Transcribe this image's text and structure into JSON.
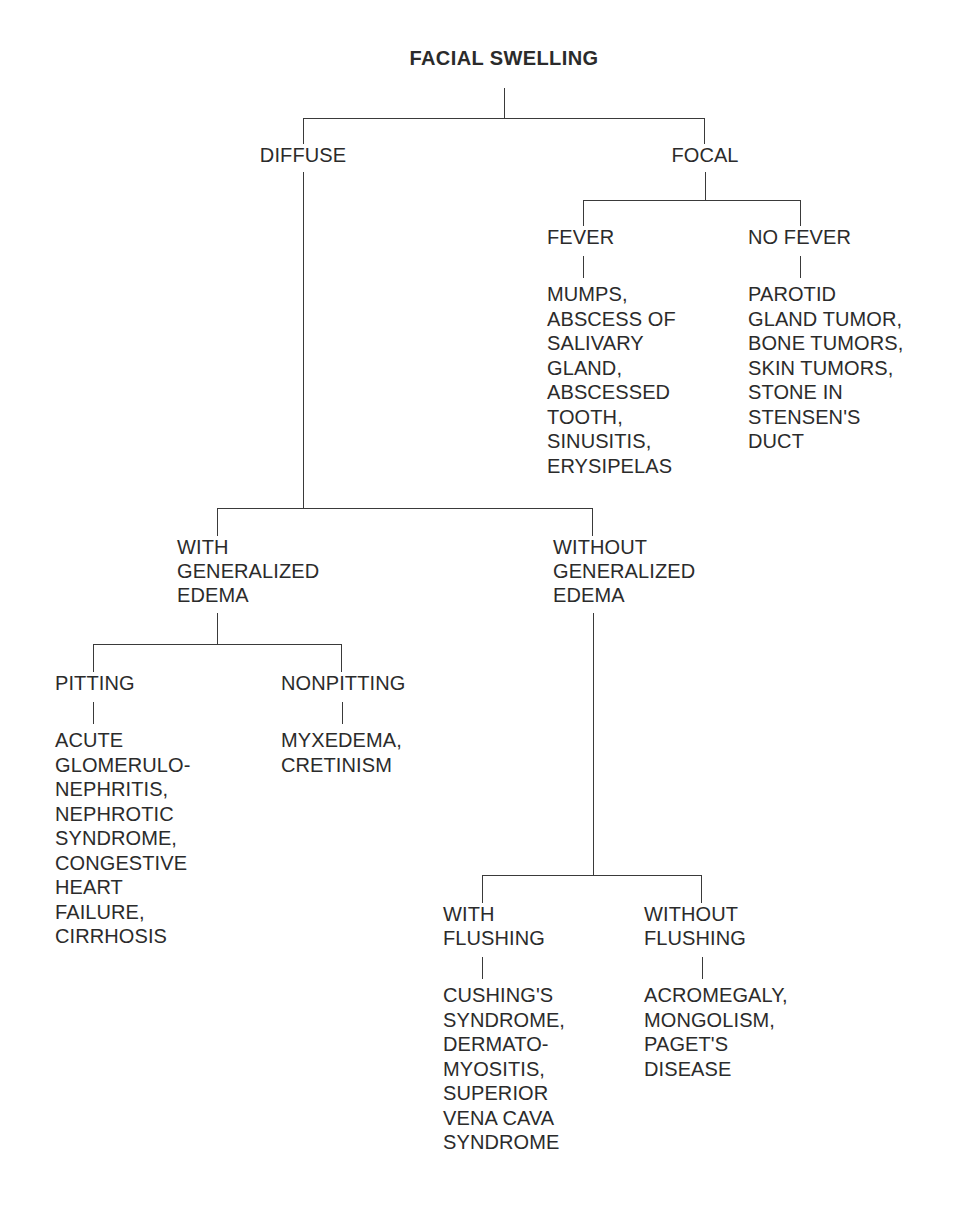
{
  "diagram": {
    "title": "FACIAL SWELLING",
    "type": "decision-tree",
    "line_color": "#3a3a3a",
    "text_color": "#2b2b2b",
    "background_color": "#ffffff"
  },
  "nodes": {
    "root": "FACIAL SWELLING",
    "diffuse": "DIFFUSE",
    "focal": "FOCAL",
    "fever": "FEVER",
    "no_fever": "NO FEVER",
    "fever_list": "MUMPS,\nABSCESS OF\nSALIVARY\nGLAND,\nABSCESSED\nTOOTH,\nSINUSITIS,\nERYSIPELAS",
    "no_fever_list": "PAROTID\nGLAND TUMOR,\nBONE TUMORS,\nSKIN TUMORS,\nSTONE IN\nSTENSEN'S\nDUCT",
    "with_generalized_edema": "WITH\nGENERALIZED\nEDEMA",
    "without_generalized_edema": "WITHOUT\nGENERALIZED\nEDEMA",
    "pitting": "PITTING",
    "nonpitting": "NONPITTING",
    "pitting_list": "ACUTE\nGLOMERULO-\nNEPHRITIS,\nNEPHROTIC\nSYNDROME,\nCONGESTIVE\nHEART\nFAILURE,\nCIRRHOSIS",
    "nonpitting_list": "MYXEDEMA,\nCRETINISM",
    "with_flushing": "WITH\nFLUSHING",
    "without_flushing": "WITHOUT\nFLUSHING",
    "with_flushing_list": "CUSHING'S\nSYNDROME,\nDERMATO-\nMYOSITIS,\nSUPERIOR\nVENA CAVA\nSYNDROME",
    "without_flushing_list": "ACROMEGALY,\nMONGOLISM,\nPAGET'S\nDISEASE"
  },
  "tree_structure": {
    "root": "FACIAL SWELLING",
    "children": [
      {
        "label": "DIFFUSE",
        "children": [
          {
            "label": "WITH GENERALIZED EDEMA",
            "children": [
              {
                "label": "PITTING",
                "diagnoses": [
                  "ACUTE GLOMERULONEPHRITIS",
                  "NEPHROTIC SYNDROME",
                  "CONGESTIVE HEART FAILURE",
                  "CIRRHOSIS"
                ]
              },
              {
                "label": "NONPITTING",
                "diagnoses": [
                  "MYXEDEMA",
                  "CRETINISM"
                ]
              }
            ]
          },
          {
            "label": "WITHOUT GENERALIZED EDEMA",
            "children": [
              {
                "label": "WITH FLUSHING",
                "diagnoses": [
                  "CUSHING'S SYNDROME",
                  "DERMATOMYOSITIS",
                  "SUPERIOR VENA CAVA SYNDROME"
                ]
              },
              {
                "label": "WITHOUT FLUSHING",
                "diagnoses": [
                  "ACROMEGALY",
                  "MONGOLISM",
                  "PAGET'S DISEASE"
                ]
              }
            ]
          }
        ]
      },
      {
        "label": "FOCAL",
        "children": [
          {
            "label": "FEVER",
            "diagnoses": [
              "MUMPS",
              "ABSCESS OF SALIVARY GLAND",
              "ABSCESSED TOOTH",
              "SINUSITIS",
              "ERYSIPELAS"
            ]
          },
          {
            "label": "NO FEVER",
            "diagnoses": [
              "PAROTID GLAND TUMOR",
              "BONE TUMORS",
              "SKIN TUMORS",
              "STONE IN STENSEN'S DUCT"
            ]
          }
        ]
      }
    ]
  }
}
